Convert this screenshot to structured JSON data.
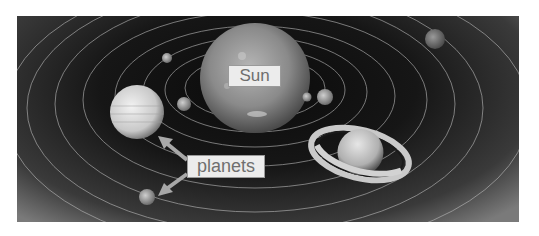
{
  "diagram": {
    "labels": {
      "sun": "Sun",
      "planets": "planets"
    },
    "colors": {
      "background": "#ffffff",
      "space": "#111111",
      "orbit": "#bdbdbd",
      "label_bg": "#ececec",
      "label_text": "#6f6f6f",
      "arrow": "#a8a8a8"
    },
    "bodies": [
      {
        "name": "sun",
        "type": "star"
      },
      {
        "name": "jupiter-like",
        "type": "planet"
      },
      {
        "name": "saturn-like",
        "type": "ringed-planet"
      },
      {
        "name": "small-planet-1",
        "type": "planet"
      },
      {
        "name": "small-planet-2",
        "type": "planet"
      },
      {
        "name": "small-planet-3",
        "type": "planet"
      },
      {
        "name": "small-planet-4",
        "type": "planet"
      },
      {
        "name": "outer-planet-top-right",
        "type": "planet"
      },
      {
        "name": "planet-bottom-left",
        "type": "planet"
      }
    ],
    "arrows": [
      {
        "from": "planets-label",
        "to": "jupiter-like"
      },
      {
        "from": "planets-label",
        "to": "planet-bottom-left"
      }
    ]
  }
}
